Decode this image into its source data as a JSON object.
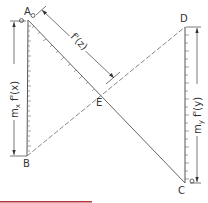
{
  "diagram": {
    "points": {
      "A": {
        "label": "A",
        "x": 28,
        "y": 20
      },
      "B": {
        "label": "B",
        "x": 27,
        "y": 156
      },
      "C": {
        "label": "C",
        "x": 185,
        "y": 183
      },
      "D": {
        "label": "D",
        "x": 185,
        "y": 27
      },
      "E": {
        "label": "E",
        "x": 101,
        "y": 97
      }
    },
    "origin_marks": {
      "A_zero": "o",
      "C_zero": "o"
    },
    "dimensions": {
      "left": "m",
      "left_sub": "x",
      "left_fn": " f'(x)",
      "right": "m",
      "right_sub": "y",
      "right_fn": " f'(y)",
      "diagonal": "f'(z)"
    },
    "colors": {
      "line": "#555555",
      "text": "#333333",
      "accent_bar": "#b5353a"
    }
  }
}
